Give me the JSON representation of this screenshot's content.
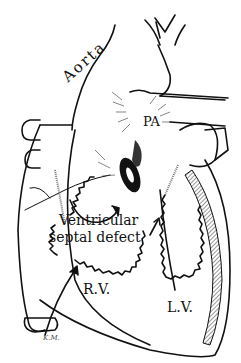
{
  "figure": {
    "labels": {
      "aorta": "Aorta",
      "pa": "PA",
      "vsd_line1": "Ventricular",
      "vsd_line2": "septal defect",
      "rv": "R.V.",
      "lv": "L.V.",
      "signature": "K.M."
    },
    "colors": {
      "ink": "#111111",
      "background": "#ffffff",
      "hatch": "#555555"
    }
  }
}
